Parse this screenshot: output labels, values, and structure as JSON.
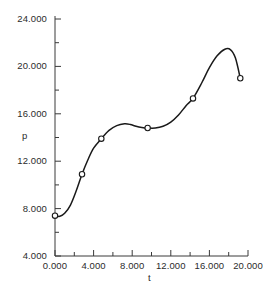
{
  "chart_data": {
    "type": "line",
    "title": "",
    "subtitle": "",
    "xlabel": "t",
    "ylabel": "p",
    "xlim": [
      0,
      20
    ],
    "ylim": [
      4,
      24
    ],
    "grid": false,
    "legend": "none",
    "x_ticks": [
      0,
      4,
      8,
      12,
      16,
      20
    ],
    "x_tick_labels": [
      "0.000",
      "4.000",
      "8.000",
      "12.000",
      "16.000",
      "20.000"
    ],
    "x_minor_ticks": [
      2,
      6,
      10,
      14,
      18
    ],
    "y_ticks": [
      4,
      8,
      12,
      16,
      20,
      24
    ],
    "y_tick_labels": [
      "4.000",
      "8.000",
      "12.000",
      "16.000",
      "20.000",
      "24.000"
    ],
    "y_minor_ticks": [
      6,
      10,
      14,
      18,
      22
    ],
    "series": [
      {
        "name": "p(t)",
        "marker": "open-circle",
        "line_color": "#1a1a1a",
        "marker_color": "#1a1a1a",
        "x": [
          0.0,
          2.8,
          4.8,
          9.6,
          14.3,
          19.2
        ],
        "y": [
          7.4,
          10.9,
          13.9,
          14.8,
          17.3,
          19.0
        ]
      }
    ],
    "curve": {
      "description": "smooth interpolating spline through the data points",
      "x": [
        0.0,
        0.5,
        1.0,
        1.6,
        2.2,
        2.8,
        3.4,
        4.0,
        4.8,
        5.6,
        6.4,
        7.2,
        7.8,
        8.4,
        9.0,
        9.6,
        10.4,
        11.2,
        12.0,
        12.8,
        13.6,
        14.3,
        15.2,
        16.0,
        16.8,
        17.6,
        18.2,
        18.7,
        19.2
      ],
      "y": [
        7.4,
        7.35,
        7.6,
        8.3,
        9.5,
        10.9,
        12.1,
        13.1,
        13.9,
        14.6,
        15.0,
        15.15,
        15.1,
        14.95,
        14.85,
        14.8,
        14.8,
        14.95,
        15.3,
        15.9,
        16.7,
        17.3,
        18.6,
        19.9,
        20.9,
        21.45,
        21.4,
        20.7,
        19.0
      ]
    }
  },
  "axis_labels": {
    "x_title": "t",
    "y_title": "p"
  }
}
